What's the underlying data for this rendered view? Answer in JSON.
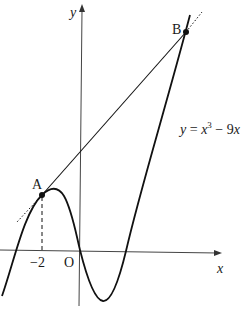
{
  "diagram": {
    "type": "function-graph",
    "function_label": {
      "lhs": "y",
      "eq": " = ",
      "var": "x",
      "exp": "3",
      "rest": " − 9",
      "var2": "x"
    },
    "axes": {
      "x_label": "x",
      "y_label": "y",
      "origin_label": "O"
    },
    "ticks": {
      "x_tick": "−2"
    },
    "points": [
      {
        "name": "A",
        "label": "A"
      },
      {
        "name": "B",
        "label": "B"
      }
    ],
    "colors": {
      "ink": "#1a1a1a",
      "background": "#ffffff"
    }
  }
}
